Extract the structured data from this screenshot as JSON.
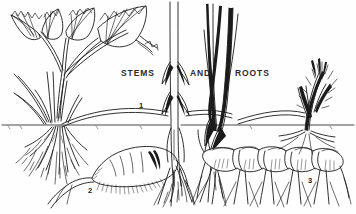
{
  "figure": {
    "title_words": {
      "stems": "STEMS",
      "and": "AND",
      "roots": "ROOTS"
    },
    "callouts": [
      {
        "number": "1",
        "subject": "stolon-runner-strawberry-plant"
      },
      {
        "number": "2",
        "subject": "taproot-tuber"
      },
      {
        "number": "3",
        "subject": "rhizome-with-shoots"
      }
    ],
    "numbers": {
      "one": "1",
      "two": "2",
      "three": "3"
    },
    "colors": {
      "background": "#fefefe",
      "ink": "#1b1b1b",
      "text": "#2b2b2b",
      "soil_line": "#4a4a4a"
    },
    "icons": {
      "strawberry_plant": "strawberry-plant-icon",
      "fibrous_roots": "fibrous-roots-icon",
      "grass_stem": "grass-stem-icon",
      "grass_blades": "grass-blades-icon",
      "taproot": "taproot-icon",
      "rhizome": "rhizome-icon",
      "shoot_tuft": "shoot-tuft-icon",
      "soil_line": "soil-line-icon",
      "runner_stolon": "runner-stolon-icon"
    }
  }
}
